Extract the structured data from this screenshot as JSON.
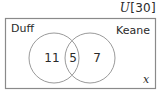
{
  "universe": {
    "symbol": "U",
    "total_text": "[30]"
  },
  "sets": [
    {
      "label": "Duff"
    },
    {
      "label": "Keane"
    }
  ],
  "regions": {
    "only_a": "11",
    "intersection": "5",
    "only_b": "7",
    "outside": "x"
  },
  "colors": {
    "stroke": "#8a8a8a",
    "text": "#2a2a2a",
    "background": "#ffffff"
  }
}
